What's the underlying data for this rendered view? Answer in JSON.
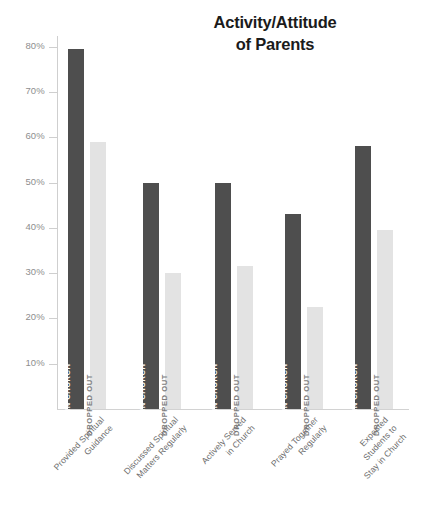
{
  "chart_data": {
    "type": "bar",
    "title": "Activity/Attitude of Parents",
    "title_line1": "Activity/Attitude",
    "title_line2": "of Parents",
    "xlabel": "",
    "ylabel": "",
    "ylim": [
      0,
      85
    ],
    "grid": false,
    "legend_position": "in-bar",
    "categories": [
      "Provided Spiritual Guidance",
      "Discussed Spiritual Matters Regularly",
      "Actively Served in Church",
      "Prayed Together Regularly",
      "Expected Students to Stay in Church"
    ],
    "series": [
      {
        "name": "STAYED IN CHURCH",
        "color": "#4e4e4e",
        "values": [
          79.5,
          50,
          50,
          43,
          58
        ]
      },
      {
        "name": "DROPPED OUT",
        "color": "#e3e3e3",
        "values": [
          59,
          30,
          31.5,
          22.5,
          39.5
        ]
      }
    ],
    "yticks": [
      {
        "value": 80,
        "label": "80%"
      },
      {
        "value": 70,
        "label": "70%"
      },
      {
        "value": 60,
        "label": "60%"
      },
      {
        "value": 50,
        "label": "50%"
      },
      {
        "value": 40,
        "label": "40%"
      },
      {
        "value": 30,
        "label": "30%"
      },
      {
        "value": 20,
        "label": "20%"
      },
      {
        "value": 10,
        "label": "10%"
      }
    ],
    "category_lines": [
      [
        "Provided Spiritual",
        "Guidance"
      ],
      [
        "Discussed Spiritual",
        "Matters Regularly"
      ],
      [
        "Actively Served",
        "in Church"
      ],
      [
        "Prayed Together",
        "Regularly"
      ],
      [
        "Expected",
        "Students to",
        "Stay in Church"
      ]
    ]
  },
  "colors": {
    "stayed": "#4e4e4e",
    "dropped": "#e3e3e3",
    "axis": "#cfcfcf",
    "tick_text": "#8e8e8e",
    "category_text": "#6d6d6d",
    "title_text": "#1b1b1b",
    "background": "#ffffff"
  }
}
